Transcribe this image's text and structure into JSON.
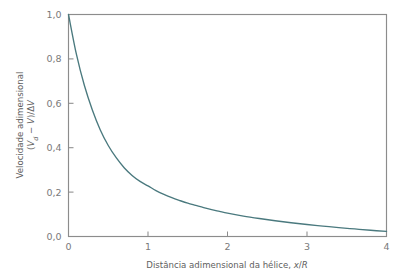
{
  "chart_data": {
    "type": "line",
    "title": "",
    "xlabel": "Distância adimensional da hélice, x/R",
    "xlabel_parts": {
      "text": "Distância adimensional da hélice, ",
      "italic_x": "x",
      "slash": "/",
      "italic_r": "R"
    },
    "ylabel": "Velocidade adimensional (V_d − V)/ΔV",
    "ylabel_line1": "Velocidade adimensional",
    "ylabel_line2_parts": {
      "open": "(",
      "v1": "V",
      "sub": "d",
      "minus": " − ",
      "v2": "V",
      "close": ")/",
      "delta": "Δ",
      "v3": "V"
    },
    "xlim": [
      0,
      4
    ],
    "ylim": [
      0,
      1
    ],
    "xticks": [
      0,
      1,
      2,
      3,
      4
    ],
    "xtick_labels": [
      "0",
      "1",
      "2",
      "3",
      "4"
    ],
    "yticks": [
      0,
      0.2,
      0.4,
      0.6,
      0.8,
      1
    ],
    "ytick_labels": [
      "0,0",
      "0,2",
      "0,4",
      "0,6",
      "0,8",
      "1,0"
    ],
    "grid": false,
    "legend": "none",
    "series": [
      {
        "name": "velocidade adimensional",
        "color": "#4a797e",
        "x": [
          0,
          0.1,
          0.2,
          0.3,
          0.4,
          0.5,
          0.6,
          0.7,
          0.8,
          0.9,
          1,
          1.1,
          1.2,
          1.3,
          1.4,
          1.5,
          1.6,
          1.7,
          1.8,
          1.9,
          2,
          2.2,
          2.4,
          2.6,
          2.8,
          3,
          3.2,
          3.4,
          3.6,
          3.8,
          4
        ],
        "values": [
          1,
          0.82,
          0.68,
          0.57,
          0.48,
          0.41,
          0.355,
          0.31,
          0.275,
          0.248,
          0.228,
          0.207,
          0.19,
          0.175,
          0.162,
          0.15,
          0.14,
          0.13,
          0.121,
          0.113,
          0.105,
          0.092,
          0.081,
          0.071,
          0.062,
          0.054,
          0.047,
          0.04,
          0.034,
          0.028,
          0.023
        ]
      }
    ],
    "colors": {
      "curve": "#4a797e",
      "frame": "#8c8c8c",
      "text": "#6b6b6b",
      "background": "#ffffff"
    }
  }
}
